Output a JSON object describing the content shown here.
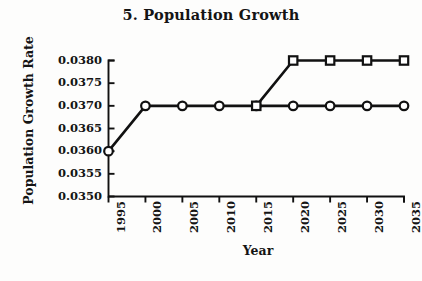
{
  "chart_data": {
    "type": "line",
    "title": "5. Population Growth",
    "xlabel": "Year",
    "ylabel": "Population Growth Rate",
    "x": [
      1995,
      2000,
      2005,
      2010,
      2015,
      2020,
      2025,
      2030,
      2035
    ],
    "xtick_labels": [
      "1995",
      "2000",
      "2005",
      "2010",
      "2015",
      "2020",
      "2025",
      "2030",
      "2035"
    ],
    "ytick_labels": [
      "0.0380",
      "0.0375",
      "0.0370",
      "0.0365",
      "0.0360",
      "0.0355",
      "0.0350"
    ],
    "ytick_values": [
      0.038,
      0.0375,
      0.037,
      0.0365,
      0.036,
      0.0355,
      0.035
    ],
    "ylim": [
      0.035,
      0.038
    ],
    "xlim": [
      1995,
      2035
    ],
    "grid": false,
    "legend": "none",
    "series": [
      {
        "name": "Baseline",
        "marker": "circle",
        "color": "#111111",
        "x": [
          1995,
          2000,
          2005,
          2010,
          2015,
          2020,
          2025,
          2030,
          2035
        ],
        "values": [
          0.036,
          0.037,
          0.037,
          0.037,
          0.037,
          0.037,
          0.037,
          0.037,
          0.037
        ]
      },
      {
        "name": "Alternative",
        "marker": "square",
        "color": "#111111",
        "x": [
          2015,
          2020,
          2025,
          2030,
          2035
        ],
        "values": [
          0.037,
          0.038,
          0.038,
          0.038,
          0.038
        ]
      }
    ]
  },
  "figure": {
    "background_color": "#fdfdfc",
    "axis_color": "#111111",
    "text_color": "#141414"
  }
}
